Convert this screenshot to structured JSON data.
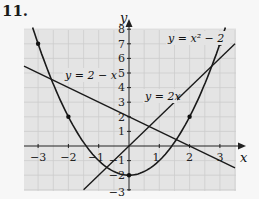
{
  "problem": {
    "number": "11."
  },
  "axes": {
    "x_label": "x",
    "y_label": "y"
  },
  "x_ticks": [
    "−3",
    "−2",
    "−1",
    "1",
    "2",
    "3"
  ],
  "y_ticks": [
    "8",
    "7",
    "6",
    "5",
    "4",
    "3",
    "2",
    "1",
    "−1",
    "−2",
    "−3"
  ],
  "equations": {
    "parabola": "y = x² − 2",
    "line_decreasing": "y = 2 − x",
    "line_increasing": "y = 2x"
  },
  "colors": {
    "curve": "#1a1a1a",
    "grid": "#cdcdcd",
    "plot_bg": "#e4e4e4"
  },
  "chart_data": {
    "type": "line",
    "title": "",
    "xlabel": "x",
    "ylabel": "y",
    "xlim": [
      -3.5,
      3.5
    ],
    "ylim": [
      -3,
      8
    ],
    "grid": true,
    "series": [
      {
        "name": "y = x² − 2",
        "kind": "parabola",
        "points": [
          [
            -3,
            7
          ],
          [
            -2,
            2
          ],
          [
            -1,
            -1
          ],
          [
            0,
            -2
          ],
          [
            1,
            -1
          ],
          [
            2,
            2
          ],
          [
            3,
            7
          ]
        ]
      },
      {
        "name": "y = 2 − x",
        "kind": "line",
        "points": [
          [
            -3.5,
            5.5
          ],
          [
            0,
            2
          ],
          [
            3.5,
            -1.5
          ]
        ]
      },
      {
        "name": "y = 2x",
        "kind": "line",
        "points": [
          [
            -1.5,
            -3
          ],
          [
            0,
            0
          ],
          [
            3.5,
            7
          ]
        ]
      }
    ],
    "marked_points": [
      [
        -3,
        7
      ],
      [
        -2,
        2
      ],
      [
        0,
        -2
      ],
      [
        2,
        2
      ],
      [
        3,
        7
      ]
    ]
  }
}
